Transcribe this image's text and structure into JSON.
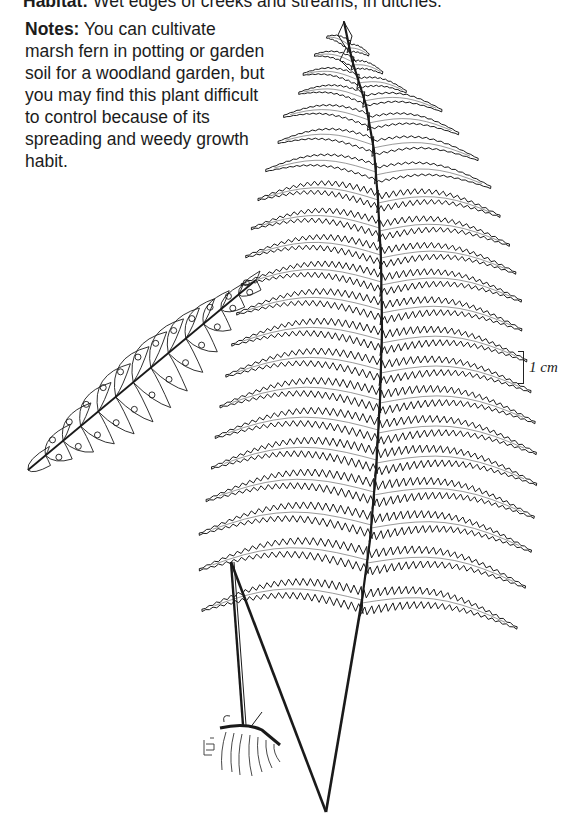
{
  "habitat": {
    "label": "Habitat:",
    "text": " Wet edges of creeks and streams, in ditches."
  },
  "notes": {
    "label": "Notes:",
    "text": " You can cultivate marsh fern in potting or garden soil for a woodland garden, but you may find this plant difficult to control because of its spreading and weedy growth habit."
  },
  "illustration": {
    "subject": "marsh fern frond with rhizome and fertile pinna detail",
    "stroke_color": "#1a1a1a",
    "scale_bar": {
      "label": "1 cm"
    },
    "artist_mark": "LB"
  }
}
